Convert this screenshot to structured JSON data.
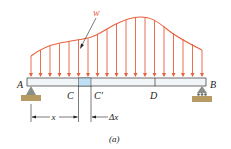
{
  "diagram": {
    "caption": "(a)",
    "load_label": "w",
    "points": {
      "A": "A",
      "B": "B",
      "C": "C",
      "C_prime": "C′",
      "D": "D"
    },
    "dimensions": {
      "x": "x",
      "dx": "Δx"
    },
    "colors": {
      "load": "#e8603c",
      "beam_fill": "#f2f5f8",
      "element_fill": "#bfe0f2",
      "ground": "#b89b62",
      "support": "#8a8f8a",
      "line": "#222222"
    },
    "arrows_x": [
      31,
      40.5,
      50,
      59.5,
      69,
      78.5,
      88,
      97.5,
      107,
      116.5,
      126,
      135.5,
      145,
      154.5,
      164,
      173.5,
      183,
      192.5,
      202
    ],
    "load_curve_y": [
      56,
      49,
      45,
      43,
      41,
      40,
      39,
      38,
      35,
      30,
      24,
      19,
      17,
      17,
      20,
      28,
      35,
      43,
      50
    ]
  }
}
